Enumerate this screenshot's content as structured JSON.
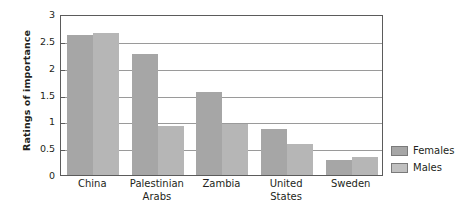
{
  "chart_data": {
    "type": "bar",
    "title": "",
    "subtitle": "",
    "xlabel": "",
    "ylabel": "Ratings of importance",
    "categories": [
      "China",
      "Palestinian\nArabs",
      "Zambia",
      "United\nStates",
      "Sweden"
    ],
    "series": [
      {
        "name": "Females",
        "color": "#a6a6a6",
        "values": [
          2.6,
          2.25,
          1.55,
          0.85,
          0.28
        ]
      },
      {
        "name": "Males",
        "color": "#b6b6b6",
        "values": [
          2.65,
          0.92,
          0.95,
          0.58,
          0.33
        ]
      }
    ],
    "ylim": [
      0,
      3
    ],
    "ytick_values": [
      0,
      0.5,
      1,
      1.5,
      2,
      2.5,
      3
    ],
    "ytick_labels": [
      "0",
      "0.5",
      "1",
      "1.5",
      "2",
      "2.5",
      "3"
    ],
    "grid": true,
    "grid_axis": "y",
    "legend_position": "right",
    "plot_border": true,
    "colors": {
      "females": "#a6a6a6",
      "males": "#b6b6b6",
      "gridline": "#9a9a9a",
      "axis": "#5b5b5b",
      "text": "#231f20",
      "background": "#ffffff"
    }
  },
  "legend": {
    "items": [
      {
        "label": "Females",
        "color": "#a6a6a6"
      },
      {
        "label": "Males",
        "color": "#c0c0c0"
      }
    ]
  }
}
